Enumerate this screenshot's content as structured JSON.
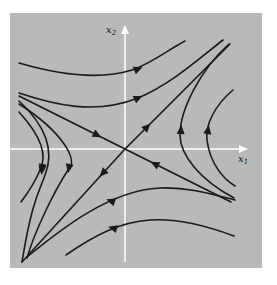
{
  "figure": {
    "background": "#ffffff",
    "panel": {
      "x": 10,
      "y": 13,
      "width": 252,
      "height": 255,
      "fill": "#b9b9b9"
    },
    "origin": {
      "x": 125,
      "y": 149
    },
    "axis_color": "#ffffff",
    "curve_color": "#1a1a1a",
    "axes": {
      "x1": {
        "label": "x",
        "sub": "1",
        "from": [
          10,
          149
        ],
        "to": [
          248,
          149
        ],
        "label_pos": [
          238,
          162
        ]
      },
      "x2": {
        "label": "x",
        "sub": "2",
        "from": [
          125,
          262
        ],
        "to": [
          125,
          25
        ],
        "label_pos": [
          106,
          33
        ]
      }
    },
    "type": "phase-portrait-saddle",
    "curves": [
      {
        "d": "M 19 63 C 60 75, 100 80, 132 70 C 150 64, 168 50, 185 41",
        "arrow": {
          "x": 138,
          "y": 69,
          "angle": -22
        }
      },
      {
        "d": "M 19 93 C 55 105, 95 115, 138 98 C 170 85, 200 58, 223 40",
        "arrow": {
          "x": 138,
          "y": 98,
          "angle": -25
        }
      },
      {
        "d": "M 19 96 L 125 149 L 231 202",
        "arrow": {
          "x": 97,
          "y": 135,
          "angle": 27
        },
        "arrow2": {
          "x": 155,
          "y": 164,
          "angle": 207
        }
      },
      {
        "d": "M 22 262 L 125 149 L 230 44",
        "arrow": {
          "x": 103,
          "y": 173,
          "angle": 134
        },
        "arrow2": {
          "x": 147,
          "y": 127,
          "angle": -46
        }
      },
      {
        "d": "M 19 101 C 45 125, 55 150, 45 175 C 40 190, 32 200, 22 262",
        "arrow": {
          "x": 42,
          "y": 170,
          "angle": 95
        }
      },
      {
        "d": "M 19 112 C 40 135, 48 155, 40 170 C 36 180, 30 190, 21 202",
        "arrow": {
          "x": 42,
          "y": 168,
          "angle": 100
        }
      },
      {
        "d": "M 19 104 C 60 130, 80 160, 68 170 C 55 190, 35 230, 27 258",
        "arrow": {
          "x": 69,
          "y": 168,
          "angle": 100
        }
      },
      {
        "d": "M 229 44 C 200 70, 180 110, 180 135 C 180 155, 200 180, 234 198",
        "arrow": {
          "x": 181,
          "y": 130,
          "angle": -85
        }
      },
      {
        "d": "M 233 90 C 215 105, 205 125, 207 140 C 210 165, 225 180, 235 186",
        "arrow": {
          "x": 208,
          "y": 130,
          "angle": -80
        }
      },
      {
        "d": "M 27 257 C 60 230, 110 190, 160 188 C 190 187, 215 195, 235 200",
        "arrow": {
          "x": 111,
          "y": 201,
          "angle": 200
        }
      },
      {
        "d": "M 66 255 C 95 235, 120 222, 150 220 C 180 218, 210 227, 234 236",
        "arrow": {
          "x": 113,
          "y": 228,
          "angle": 195
        }
      }
    ]
  }
}
